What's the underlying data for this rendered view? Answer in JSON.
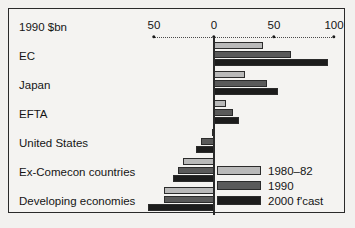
{
  "chart_data": {
    "type": "bar",
    "orientation": "horizontal",
    "title": "1990 $bn",
    "xlabel": "",
    "ylabel": "",
    "xlim": [
      -60,
      105
    ],
    "xticks": [
      -50,
      0,
      50,
      100
    ],
    "xtick_labels": [
      "50",
      "0",
      "50",
      "100"
    ],
    "grid": false,
    "legend_position": "inside-bottom-right",
    "categories": [
      "EC",
      "Japan",
      "EFTA",
      "United States",
      "Ex-Comecon countries",
      "Developing economies"
    ],
    "series": [
      {
        "name": "1980–82",
        "color": "#b9b9b9",
        "values": [
          41,
          26,
          10,
          -2,
          -26,
          -42
        ]
      },
      {
        "name": "1990",
        "color": "#5a5a5a",
        "values": [
          64,
          44,
          16,
          -11,
          -30,
          -42
        ]
      },
      {
        "name": "2000 f'cast",
        "color": "#1c1c1c",
        "values": [
          95,
          53,
          21,
          -15,
          -34,
          -55
        ]
      }
    ]
  },
  "frame": {
    "border_color": "#2a2a2a",
    "background_color": "#f4f3f1"
  },
  "axis": {
    "header": "1990 $bn",
    "ticks": [
      {
        "label": "50",
        "value": -50
      },
      {
        "label": "0",
        "value": 0
      },
      {
        "label": "50",
        "value": 50
      },
      {
        "label": "100",
        "value": 100
      }
    ]
  },
  "rows": [
    {
      "label": "EC"
    },
    {
      "label": "Japan"
    },
    {
      "label": "EFTA"
    },
    {
      "label": "United States"
    },
    {
      "label": "Ex-Comecon countries"
    },
    {
      "label": "Developing economies"
    }
  ],
  "legend": [
    {
      "label": "1980–82",
      "color": "#b9b9b9"
    },
    {
      "label": "1990",
      "color": "#5a5a5a"
    },
    {
      "label": "2000 f'cast",
      "color": "#1c1c1c"
    }
  ]
}
